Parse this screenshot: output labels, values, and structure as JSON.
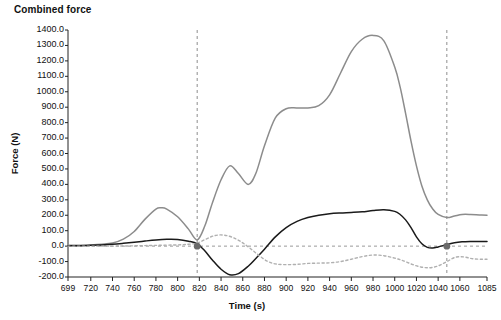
{
  "chart_data": {
    "type": "line",
    "title": "Combined force",
    "xlabel": "Time (s)",
    "ylabel": "Force (N)",
    "xlim": [
      699,
      1085
    ],
    "ylim": [
      -200,
      1400
    ],
    "grid": false,
    "legend_position": "none",
    "y_ticks": [
      "1400.0",
      "1300.0",
      "1200.0",
      "1100.0",
      "1000.0",
      "900.0",
      "800.0",
      "700.0",
      "600.0",
      "500.0",
      "400.0",
      "300.0",
      "200.0",
      "100.0",
      "0.0",
      "-100.0",
      "-200.0"
    ],
    "y_tick_values": [
      1400,
      1300,
      1200,
      1100,
      1000,
      900,
      800,
      700,
      600,
      500,
      400,
      300,
      200,
      100,
      0,
      -100,
      -200
    ],
    "x_ticks": [
      "699",
      "720",
      "740",
      "760",
      "780",
      "800",
      "820",
      "840",
      "860",
      "880",
      "900",
      "920",
      "940",
      "960",
      "980",
      "1000",
      "1020",
      "1040",
      "1060",
      "1085"
    ],
    "x_tick_values": [
      699,
      720,
      740,
      760,
      780,
      800,
      820,
      840,
      860,
      880,
      900,
      920,
      940,
      960,
      980,
      1000,
      1020,
      1040,
      1060,
      1085
    ],
    "series": [
      {
        "name": "combined-force-gray",
        "style": "solid",
        "color": "#8c8c8c",
        "x": [
          699,
          710,
          720,
          730,
          740,
          750,
          760,
          770,
          780,
          785,
          790,
          800,
          810,
          818,
          825,
          832,
          840,
          848,
          856,
          865,
          872,
          880,
          890,
          900,
          910,
          920,
          930,
          940,
          950,
          960,
          970,
          980,
          990,
          1000,
          1005,
          1010,
          1015,
          1020,
          1025,
          1030,
          1035,
          1040,
          1048,
          1055,
          1062,
          1070,
          1078,
          1085
        ],
        "y": [
          5,
          6,
          8,
          12,
          20,
          45,
          95,
          175,
          240,
          248,
          240,
          190,
          110,
          40,
          130,
          280,
          430,
          520,
          470,
          400,
          470,
          650,
          830,
          890,
          895,
          895,
          910,
          980,
          1120,
          1260,
          1340,
          1365,
          1330,
          1160,
          1030,
          860,
          680,
          520,
          390,
          300,
          240,
          205,
          185,
          195,
          205,
          205,
          202,
          200
        ]
      },
      {
        "name": "combined-force-black",
        "style": "solid",
        "color": "#1a1a1a",
        "x": [
          699,
          710,
          720,
          730,
          740,
          750,
          760,
          770,
          780,
          790,
          800,
          810,
          818,
          825,
          832,
          840,
          848,
          856,
          865,
          872,
          880,
          890,
          900,
          910,
          920,
          930,
          940,
          950,
          960,
          970,
          980,
          990,
          1000,
          1005,
          1010,
          1015,
          1020,
          1025,
          1030,
          1035,
          1040,
          1048,
          1055,
          1062,
          1070,
          1078,
          1085
        ],
        "y": [
          2,
          3,
          5,
          8,
          12,
          18,
          25,
          33,
          40,
          44,
          43,
          32,
          15,
          -30,
          -90,
          -150,
          -185,
          -178,
          -130,
          -80,
          -20,
          60,
          120,
          160,
          185,
          200,
          210,
          215,
          218,
          222,
          230,
          235,
          225,
          205,
          170,
          120,
          60,
          15,
          -8,
          -12,
          -5,
          10,
          22,
          28,
          30,
          30,
          30
        ]
      },
      {
        "name": "combined-force-dotted",
        "style": "dotted",
        "color": "#b0b0b0",
        "x": [
          699,
          720,
          740,
          760,
          780,
          800,
          810,
          818,
          826,
          834,
          842,
          850,
          858,
          866,
          874,
          882,
          890,
          900,
          910,
          920,
          930,
          940,
          950,
          960,
          970,
          980,
          990,
          1000,
          1008,
          1016,
          1024,
          1032,
          1040,
          1048,
          1056,
          1064,
          1072,
          1080,
          1085
        ],
        "y": [
          0,
          0,
          0,
          2,
          5,
          8,
          12,
          20,
          45,
          68,
          72,
          58,
          30,
          -10,
          -55,
          -95,
          -115,
          -120,
          -118,
          -112,
          -110,
          -108,
          -100,
          -85,
          -68,
          -58,
          -62,
          -78,
          -95,
          -118,
          -135,
          -140,
          -128,
          -100,
          -72,
          -70,
          -82,
          -85,
          -85
        ]
      },
      {
        "name": "zero-reference-line",
        "style": "dashed",
        "color": "#9a9a9a",
        "x": [
          699,
          1085
        ],
        "y": [
          0,
          0
        ]
      }
    ],
    "annotations": [
      {
        "name": "vertical-marker-left",
        "type": "vline",
        "x": 818,
        "style": "dashed",
        "color": "#8e8e8e"
      },
      {
        "name": "vertical-marker-right",
        "type": "vline",
        "x": 1048,
        "style": "dashed",
        "color": "#8e8e8e"
      },
      {
        "name": "marker-point-left",
        "type": "point",
        "x": 818,
        "y": 0,
        "color": "#6a6a6a"
      },
      {
        "name": "marker-point-right",
        "type": "point",
        "x": 1048,
        "y": 0,
        "color": "#6a6a6a"
      }
    ]
  }
}
